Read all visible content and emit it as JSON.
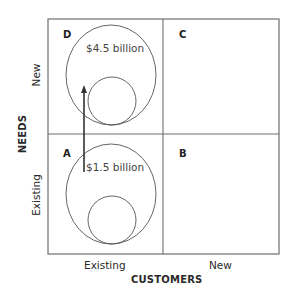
{
  "diagram": {
    "type": "2x2 matrix",
    "x_axis": {
      "title": "CUSTOMERS",
      "categories": [
        "Existing",
        "New"
      ]
    },
    "y_axis": {
      "title": "NEEDS",
      "categories": [
        "Existing",
        "New"
      ]
    },
    "quadrants": {
      "A": {
        "letter": "A",
        "position": "bottom-left",
        "value": "$1.5 billion"
      },
      "B": {
        "letter": "B",
        "position": "bottom-right"
      },
      "C": {
        "letter": "C",
        "position": "top-right"
      },
      "D": {
        "letter": "D",
        "position": "top-left",
        "value": "$4.5 billion"
      }
    },
    "arrow": {
      "from": "A",
      "to": "D"
    },
    "colors": {
      "grid_line": "#6e6e6e",
      "circle_line": "#555555",
      "arrow": "#333333",
      "text": "#2a2a2a"
    }
  }
}
